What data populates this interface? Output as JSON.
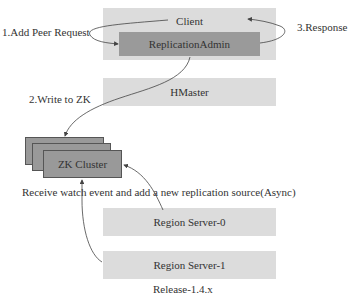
{
  "diagram": {
    "nodes": {
      "client": "Client",
      "replication_admin": "ReplicationAdmin",
      "hmaster": "HMaster",
      "zk_cluster": "ZK Cluster",
      "region_server_0": "Region Server-0",
      "region_server_1": "Region Server-1"
    },
    "edges": {
      "add_peer_request": "1.Add Peer Request",
      "write_to_zk": "2.Write to ZK",
      "response": "3.Response",
      "watch_event": "Receive watch event and add a new replication source(Async)"
    },
    "caption": "Release-1.4.x",
    "colors": {
      "light_box": "#dcdcdc",
      "dark_box": "#9a9a9a",
      "zk_box": "#999999",
      "arrow": "#444444"
    }
  }
}
